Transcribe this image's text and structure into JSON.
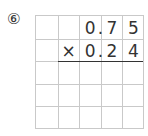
{
  "problem_number": "⑥",
  "multiplicand": [
    "",
    "",
    "0",
    "7",
    "5"
  ],
  "multiplier": [
    "",
    "×",
    "0",
    "2",
    "4"
  ],
  "multiplicand_decimal_after_col": 2,
  "multiplier_decimal_after_col": 2,
  "decimal_mark": ".",
  "rows": 5,
  "cols": 5
}
